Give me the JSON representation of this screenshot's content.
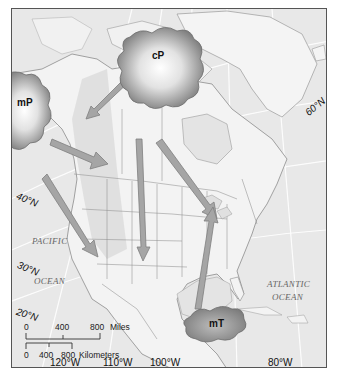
{
  "map": {
    "title": "Air masses affecting North America",
    "air_masses": [
      {
        "id": "cP",
        "label": "cP",
        "meaning": "continental polar"
      },
      {
        "id": "mP",
        "label": "mP",
        "meaning": "maritime polar"
      },
      {
        "id": "mT",
        "label": "mT",
        "meaning": "maritime tropical"
      }
    ],
    "latitude_labels": [
      "60°N",
      "40°N",
      "30°N",
      "20°N"
    ],
    "longitude_labels": [
      "120°W",
      "110°W",
      "100°W",
      "80°W"
    ],
    "ocean_labels": {
      "pacific": [
        "PACIFIC",
        "OCEAN"
      ],
      "atlantic": [
        "ATLANTIC",
        "OCEAN"
      ]
    },
    "scale_bar": {
      "miles": {
        "ticks": [
          "0",
          "400",
          "800"
        ],
        "unit": "Miles"
      },
      "kilometers": {
        "ticks": [
          "0",
          "400",
          "800"
        ],
        "unit": "Kilometers"
      }
    },
    "colors": {
      "land": "#f2f2f2",
      "water": "#e6e6e6",
      "mass_fill": "#8a8a8a",
      "arrow_fill": "#9a9a9a",
      "border": "#555555"
    }
  }
}
